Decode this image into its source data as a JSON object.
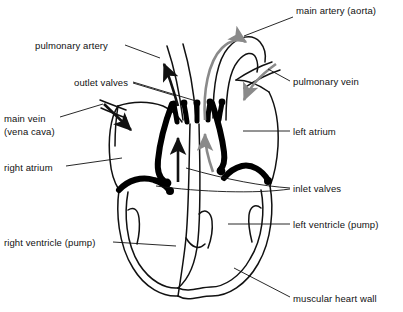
{
  "diagram": {
    "type": "anatomical-cross-section",
    "colors": {
      "outline": "#111111",
      "valve_fill": "#000000",
      "deoxygenated_arrow": "#111111",
      "oxygenated_arrow": "#8a8a8a",
      "background": "#ffffff"
    },
    "labels": [
      {
        "id": "main-artery-aorta",
        "text": "main artery (aorta)",
        "x": 296,
        "y": 5,
        "align": "left"
      },
      {
        "id": "pulmonary-artery",
        "text": "pulmonary artery",
        "x": 35,
        "y": 40,
        "align": "left"
      },
      {
        "id": "outlet-valves",
        "text": "outlet valves",
        "x": 74,
        "y": 77,
        "align": "left"
      },
      {
        "id": "pulmonary-vein",
        "text": "pulmonary vein",
        "x": 293,
        "y": 76,
        "align": "left"
      },
      {
        "id": "main-vein-line1",
        "text": "main vein",
        "x": 4,
        "y": 113,
        "align": "left"
      },
      {
        "id": "main-vein-line2",
        "text": "(vena cava)",
        "x": 4,
        "y": 126,
        "align": "left"
      },
      {
        "id": "left-atrium",
        "text": "left atrium",
        "x": 293,
        "y": 126,
        "align": "left"
      },
      {
        "id": "right-atrium",
        "text": "right atrium",
        "x": 4,
        "y": 162,
        "align": "left"
      },
      {
        "id": "inlet-valves",
        "text": "inlet valves",
        "x": 293,
        "y": 183,
        "align": "left"
      },
      {
        "id": "left-ventricle",
        "text": "left ventricle (pump)",
        "x": 293,
        "y": 219,
        "align": "left"
      },
      {
        "id": "right-ventricle",
        "text": "right ventricle (pump)",
        "x": 4,
        "y": 237,
        "align": "left"
      },
      {
        "id": "muscular-heart-wall",
        "text": "muscular heart wall",
        "x": 293,
        "y": 293,
        "align": "left"
      }
    ],
    "flow_legend": {
      "black_arrows": "deoxygenated blood flow",
      "gray_arrows": "oxygenated blood flow"
    }
  }
}
